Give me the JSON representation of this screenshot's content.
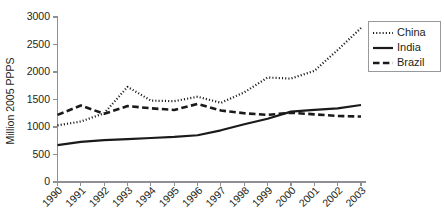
{
  "chart_data": {
    "type": "line",
    "title": "",
    "xlabel": "",
    "ylabel": "Million 2005 PPPS",
    "x": [
      "1990",
      "1991",
      "1992",
      "1993",
      "1994",
      "1995",
      "1996",
      "1997",
      "1998",
      "1999",
      "2000",
      "2001",
      "2002",
      "2003"
    ],
    "xtick_labels": [
      "1990",
      "1991",
      "1992",
      "1993",
      "1994",
      "1995",
      "1996",
      "1997",
      "1998",
      "1999",
      "2000",
      "2001",
      "2002",
      "2003"
    ],
    "ytick_labels": [
      "0",
      "500",
      "1000",
      "1500",
      "2000",
      "2500",
      "3000"
    ],
    "ytick_values": [
      0,
      500,
      1000,
      1500,
      2000,
      2500,
      3000
    ],
    "ylim": [
      0,
      3000
    ],
    "grid": false,
    "legend_position": "upper right",
    "series": [
      {
        "name": "China",
        "style": "dotted",
        "color": "#1a1a1a",
        "values": [
          1030,
          1100,
          1250,
          1730,
          1480,
          1470,
          1550,
          1440,
          1630,
          1900,
          1880,
          2020,
          2400,
          2800
        ]
      },
      {
        "name": "India",
        "style": "solid",
        "color": "#1a1a1a",
        "values": [
          670,
          730,
          760,
          780,
          800,
          820,
          850,
          940,
          1050,
          1150,
          1280,
          1310,
          1340,
          1400
        ]
      },
      {
        "name": "Brazil",
        "style": "dashed",
        "color": "#1a1a1a",
        "values": [
          1220,
          1390,
          1240,
          1380,
          1340,
          1310,
          1420,
          1300,
          1250,
          1220,
          1260,
          1230,
          1200,
          1190
        ]
      }
    ]
  },
  "legend": {
    "entries": [
      {
        "label": "China",
        "style": "dotted"
      },
      {
        "label": "India",
        "style": "solid"
      },
      {
        "label": "Brazil",
        "style": "dashed"
      }
    ]
  },
  "axes": {
    "y_axis_title": "Million 2005 PPPS"
  }
}
